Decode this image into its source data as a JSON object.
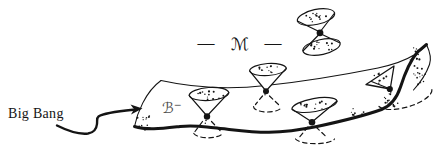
{
  "diagram": {
    "labels": {
      "big_bang": "Big Bang",
      "dash_left": "—",
      "manifold": "ℳ",
      "dash_right": "—",
      "boundary": "ℬ",
      "boundary_sup": "−"
    },
    "colors": {
      "background": "#ffffff",
      "ink": "#141414",
      "boundary_label": "#4f4f4f"
    }
  }
}
